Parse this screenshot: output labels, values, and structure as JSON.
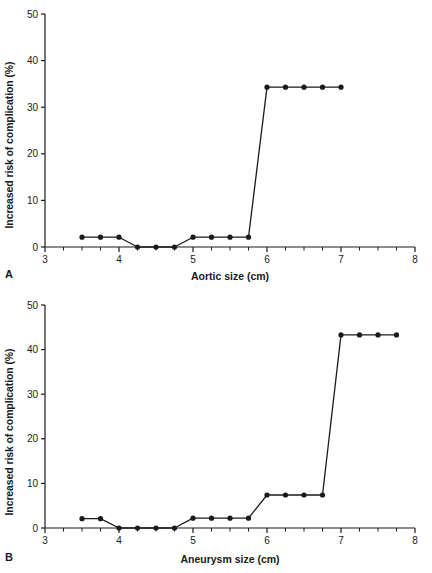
{
  "figure": {
    "panels": [
      {
        "letter": "A",
        "xlabel": "Aortic size (cm)",
        "ylabel": "Increased risk of complication (%)"
      },
      {
        "letter": "B",
        "xlabel": "Aneurysm size (cm)",
        "ylabel": "Increased risk of complication (%)"
      }
    ]
  },
  "chart_data": [
    {
      "type": "line",
      "panel": "A",
      "title": "",
      "xlabel": "Aortic size (cm)",
      "ylabel": "Increased risk of complication (%)",
      "xlim": [
        3,
        8
      ],
      "ylim": [
        0,
        50
      ],
      "xticks": [
        3,
        4,
        5,
        6,
        7,
        8
      ],
      "xticklabels": [
        "3",
        "4",
        "5",
        "6",
        "7",
        "8"
      ],
      "xminorticks": [
        3.25,
        3.5,
        3.75,
        4.25,
        4.5,
        4.75,
        5.25,
        5.5,
        5.75,
        6.25,
        6.5,
        6.75,
        7.25,
        7.5,
        7.75
      ],
      "yticks": [
        0,
        10,
        20,
        30,
        40,
        50
      ],
      "yticklabels": [
        "0",
        "10",
        "20",
        "30",
        "40",
        "50"
      ],
      "grid": false,
      "legend": "none",
      "marker": "filled-circle",
      "color": "#1a1a1a",
      "x": [
        3.5,
        3.75,
        4.0,
        4.25,
        4.5,
        4.75,
        5.0,
        5.25,
        5.5,
        5.75,
        6.0,
        6.25,
        6.5,
        6.75,
        7.0
      ],
      "y": [
        2.1,
        2.1,
        2.1,
        0.0,
        0.0,
        0.0,
        2.1,
        2.1,
        2.1,
        2.1,
        34.3,
        34.3,
        34.3,
        34.3,
        34.3
      ]
    },
    {
      "type": "line",
      "panel": "B",
      "title": "",
      "xlabel": "Aneurysm size (cm)",
      "ylabel": "Increased risk of complication (%)",
      "xlim": [
        3,
        8
      ],
      "ylim": [
        0,
        50
      ],
      "xticks": [
        3,
        4,
        5,
        6,
        7,
        8
      ],
      "xticklabels": [
        "3",
        "4",
        "5",
        "6",
        "7",
        "8"
      ],
      "xminorticks": [
        3.25,
        3.5,
        3.75,
        4.25,
        4.5,
        4.75,
        5.25,
        5.5,
        5.75,
        6.25,
        6.5,
        6.75,
        7.25,
        7.5,
        7.75
      ],
      "yticks": [
        0,
        10,
        20,
        30,
        40,
        50
      ],
      "yticklabels": [
        "0",
        "10",
        "20",
        "30",
        "40",
        "50"
      ],
      "grid": false,
      "legend": "none",
      "marker": "filled-circle",
      "color": "#1a1a1a",
      "x": [
        3.5,
        3.75,
        4.0,
        4.25,
        4.5,
        4.75,
        5.0,
        5.25,
        5.5,
        5.75,
        6.0,
        6.25,
        6.5,
        6.75,
        7.0,
        7.25,
        7.5,
        7.75
      ],
      "y": [
        2.1,
        2.1,
        0.0,
        0.0,
        0.0,
        0.0,
        2.2,
        2.2,
        2.2,
        2.2,
        7.4,
        7.4,
        7.4,
        7.4,
        43.3,
        43.3,
        43.3,
        43.3
      ]
    }
  ]
}
